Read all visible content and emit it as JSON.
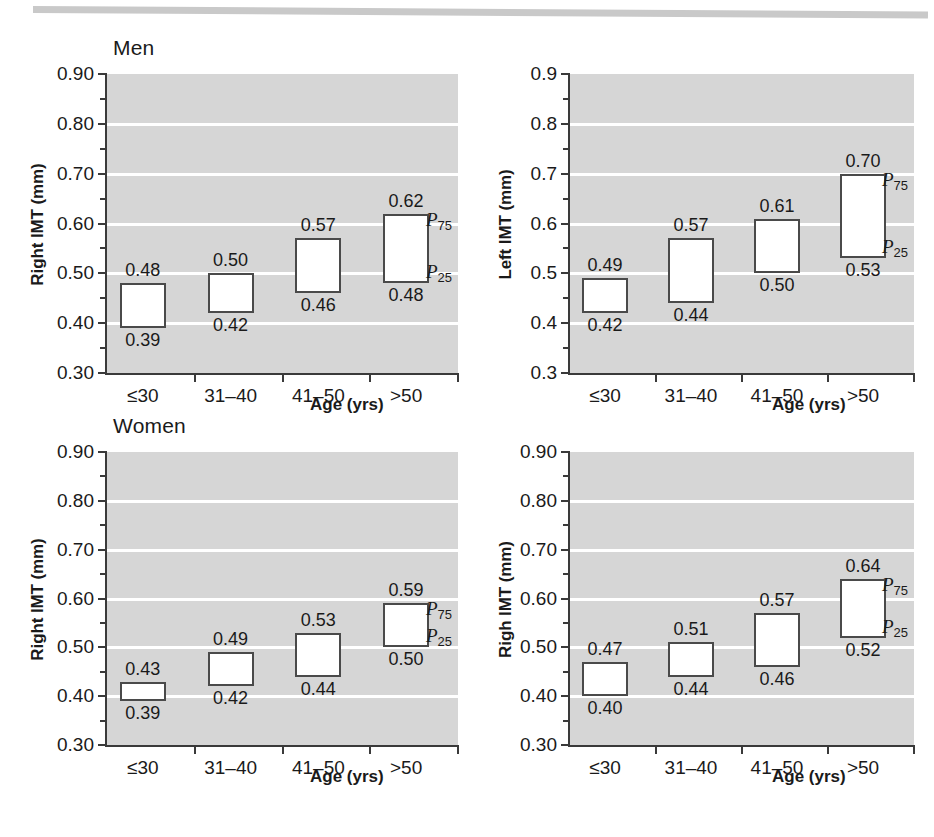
{
  "figure": {
    "panels": [
      {
        "id": "men-right",
        "title": "Men",
        "ylabel": "Right IMT (mm)",
        "xlabel": "Age (yrs)",
        "p75_annotation": "P",
        "p75_sub": "75",
        "p25_annotation": "P",
        "p25_sub": "25",
        "ytick_labels": [
          "0.90",
          "0.80",
          "0.70",
          "0.60",
          "0.50",
          "0.40",
          "0.30"
        ],
        "xtick_labels": [
          "≤30",
          "31–40",
          "41–50",
          ">50"
        ],
        "box_labels_top": [
          "0.48",
          "0.50",
          "0.57",
          "0.62"
        ],
        "box_labels_bottom": [
          "0.39",
          "0.42",
          "0.46",
          "0.48"
        ]
      },
      {
        "id": "men-left",
        "title": "",
        "ylabel": "Left IMT (mm)",
        "xlabel": "Age (yrs)",
        "p75_annotation": "P",
        "p75_sub": "75",
        "p25_annotation": "P",
        "p25_sub": "25",
        "ytick_labels": [
          "0.9",
          "0.8",
          "0.7",
          "0.6",
          "0.5",
          "0.4",
          "0.3"
        ],
        "xtick_labels": [
          "≤30",
          "31–40",
          "41–50",
          ">50"
        ],
        "box_labels_top": [
          "0.49",
          "0.57",
          "0.61",
          "0.70"
        ],
        "box_labels_bottom": [
          "0.42",
          "0.44",
          "0.50",
          "0.53"
        ]
      },
      {
        "id": "women-right",
        "title": "Women",
        "ylabel": "Right IMT (mm)",
        "xlabel": "Age (yrs)",
        "p75_annotation": "P",
        "p75_sub": "75",
        "p25_annotation": "P",
        "p25_sub": "25",
        "ytick_labels": [
          "0.90",
          "0.80",
          "0.70",
          "0.60",
          "0.50",
          "0.40",
          "0.30"
        ],
        "xtick_labels": [
          "≤30",
          "31–40",
          "41–50",
          ">50"
        ],
        "box_labels_top": [
          "0.43",
          "0.49",
          "0.53",
          "0.59"
        ],
        "box_labels_bottom": [
          "0.39",
          "0.42",
          "0.44",
          "0.50"
        ]
      },
      {
        "id": "women-left",
        "title": "",
        "ylabel": "Righ IMT (mm)",
        "xlabel": "Age (yrs)",
        "p75_annotation": "P",
        "p75_sub": "75",
        "p25_annotation": "P",
        "p25_sub": "25",
        "ytick_labels": [
          "0.90",
          "0.80",
          "0.70",
          "0.60",
          "0.50",
          "0.40",
          "0.30"
        ],
        "xtick_labels": [
          "≤30",
          "31–40",
          "41–50",
          ">50"
        ],
        "box_labels_top": [
          "0.47",
          "0.51",
          "0.57",
          "0.64"
        ],
        "box_labels_bottom": [
          "0.40",
          "0.44",
          "0.46",
          "0.52"
        ]
      }
    ],
    "colors": {
      "plot_background": "#d6d6d6",
      "gridline": "#ffffff",
      "axis": "#3a3a3a",
      "box_fill": "#ffffff",
      "box_stroke": "#4a4a4a",
      "text": "#1a1a1a",
      "top_bar": "#c9c9c9"
    }
  },
  "chart_data": [
    {
      "type": "bar",
      "id": "men-right-imt",
      "title": "Men",
      "xlabel": "Age (yrs)",
      "ylabel": "Right IMT (mm)",
      "categories": [
        "≤30",
        "31–40",
        "41–50",
        ">50"
      ],
      "ylim": [
        0.3,
        0.9
      ],
      "ytick_major": [
        0.3,
        0.4,
        0.5,
        0.6,
        0.7,
        0.8,
        0.9
      ],
      "ytick_minor": [
        0.35,
        0.45,
        0.55,
        0.65,
        0.75,
        0.85
      ],
      "grid": true,
      "legend": "none",
      "annotations": [
        "P75",
        "P25"
      ],
      "series": [
        {
          "name": "P25 (box lower edge)",
          "values": [
            0.39,
            0.42,
            0.46,
            0.48
          ]
        },
        {
          "name": "P75 (box upper edge)",
          "values": [
            0.48,
            0.5,
            0.57,
            0.62
          ]
        }
      ]
    },
    {
      "type": "bar",
      "id": "men-left-imt",
      "title": "Men",
      "xlabel": "Age (yrs)",
      "ylabel": "Left IMT (mm)",
      "categories": [
        "≤30",
        "31–40",
        "41–50",
        ">50"
      ],
      "ylim": [
        0.3,
        0.9
      ],
      "ytick_major": [
        0.3,
        0.4,
        0.5,
        0.6,
        0.7,
        0.8,
        0.9
      ],
      "ytick_minor": [
        0.35,
        0.45,
        0.55,
        0.65,
        0.75,
        0.85
      ],
      "grid": true,
      "legend": "none",
      "annotations": [
        "P75",
        "P25"
      ],
      "series": [
        {
          "name": "P25 (box lower edge)",
          "values": [
            0.42,
            0.44,
            0.5,
            0.53
          ]
        },
        {
          "name": "P75 (box upper edge)",
          "values": [
            0.49,
            0.57,
            0.61,
            0.7
          ]
        }
      ]
    },
    {
      "type": "bar",
      "id": "women-right-imt",
      "title": "Women",
      "xlabel": "Age (yrs)",
      "ylabel": "Right IMT (mm)",
      "categories": [
        "≤30",
        "31–40",
        "41–50",
        ">50"
      ],
      "ylim": [
        0.3,
        0.9
      ],
      "ytick_major": [
        0.3,
        0.4,
        0.5,
        0.6,
        0.7,
        0.8,
        0.9
      ],
      "ytick_minor": [
        0.35,
        0.45,
        0.55,
        0.65,
        0.75,
        0.85
      ],
      "grid": true,
      "legend": "none",
      "annotations": [
        "P75",
        "P25"
      ],
      "series": [
        {
          "name": "P25 (box lower edge)",
          "values": [
            0.39,
            0.42,
            0.44,
            0.5
          ]
        },
        {
          "name": "P75 (box upper edge)",
          "values": [
            0.43,
            0.49,
            0.53,
            0.59
          ]
        }
      ]
    },
    {
      "type": "bar",
      "id": "women-left-imt",
      "title": "Women",
      "xlabel": "Age (yrs)",
      "ylabel": "Righ IMT (mm)",
      "categories": [
        "≤30",
        "31–40",
        "41–50",
        ">50"
      ],
      "ylim": [
        0.3,
        0.9
      ],
      "ytick_major": [
        0.3,
        0.4,
        0.5,
        0.6,
        0.7,
        0.8,
        0.9
      ],
      "ytick_minor": [
        0.35,
        0.45,
        0.55,
        0.65,
        0.75,
        0.85
      ],
      "grid": true,
      "legend": "none",
      "annotations": [
        "P75",
        "P25"
      ],
      "series": [
        {
          "name": "P25 (box lower edge)",
          "values": [
            0.4,
            0.44,
            0.46,
            0.52
          ]
        },
        {
          "name": "P75 (box upper edge)",
          "values": [
            0.47,
            0.51,
            0.57,
            0.64
          ]
        }
      ]
    }
  ]
}
